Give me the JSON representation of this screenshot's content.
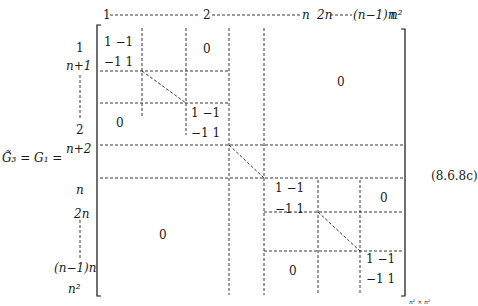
{
  "equation": {
    "lhs": "G̃₃ = G₁ =",
    "label": "(8.6.8c)",
    "size_subscript": "n² × n²"
  },
  "column_labels": [
    "1",
    "2",
    "n",
    "2n",
    "(n−1)n",
    "n²"
  ],
  "row_labels": [
    "1",
    "n+1",
    "2",
    "n+2",
    "n",
    "2n",
    "(n−1)n",
    "n²"
  ],
  "blocks": {
    "b11": {
      "r1": "1  −1",
      "r2": "−1  1"
    },
    "b22": {
      "r1": "1  −1",
      "r2": "−1  1"
    },
    "bnn1": {
      "r1": "1  −1",
      "r2": "−1  1"
    },
    "bnn2": {
      "r1": "1  −1",
      "r2": "−1  1"
    },
    "zero": "0"
  }
}
